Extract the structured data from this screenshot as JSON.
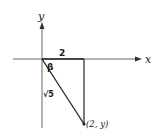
{
  "diagram": {
    "axes": {
      "x_label": "x",
      "y_label": "y"
    },
    "triangle": {
      "horizontal_side_label": "2",
      "angle_label": "β",
      "hypotenuse_label": "√5",
      "vertex_label": "(2, y)"
    },
    "colors": {
      "line": "#2a2a2a",
      "axis": "#555555",
      "background": "#ffffff"
    }
  }
}
